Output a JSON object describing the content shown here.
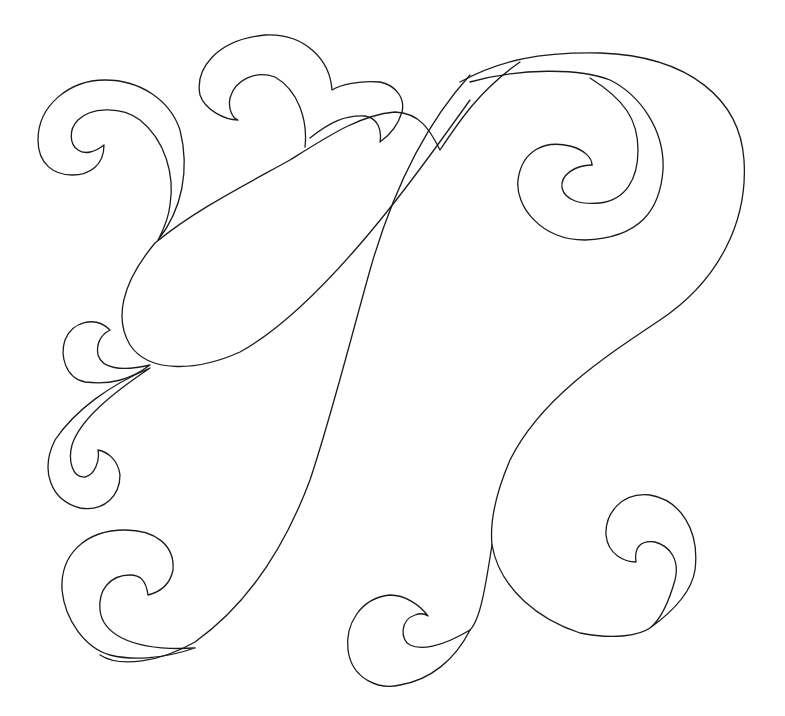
{
  "artwork": {
    "title": "Paisley swirl line-art",
    "subject": "Outline drawing of a paisley teardrop with scroll swirls",
    "background_color": "#ffffff",
    "stroke_color": "#1a1a1a",
    "elements": [
      {
        "name": "paisley-teardrop",
        "description": "Large diagonal teardrop/paisley body, upper left"
      },
      {
        "name": "large-tail-swoop",
        "description": "Long curving tail sweeping from upper right down to the bottom center"
      },
      {
        "name": "upper-right-spiral",
        "description": "Double-outlined spiral inside the upper right loop"
      },
      {
        "name": "top-left-scroll",
        "description": "Curl at the top left"
      },
      {
        "name": "top-center-scrolls",
        "description": "Two cresting curls above the teardrop"
      },
      {
        "name": "left-small-curl",
        "description": "Small curl at left middle"
      },
      {
        "name": "left-hook-curl",
        "description": "Hook curl below the teardrop"
      },
      {
        "name": "bottom-left-scroll",
        "description": "Large curl at the bottom left"
      },
      {
        "name": "bottom-center-curl",
        "description": "Curl at bottom center"
      },
      {
        "name": "bottom-right-scroll",
        "description": "Curl at the bottom right"
      }
    ]
  }
}
